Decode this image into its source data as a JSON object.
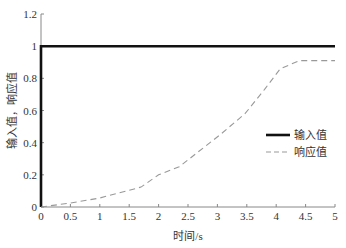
{
  "chart_data": {
    "type": "line",
    "title": "",
    "xlabel": "时间/s",
    "ylabel": "输入值，响应值",
    "xlim": [
      0,
      5
    ],
    "ylim": [
      0,
      1.2
    ],
    "x_ticks": [
      0,
      0.5,
      1,
      1.5,
      2,
      2.5,
      3,
      3.5,
      4,
      4.5,
      5
    ],
    "x_tick_labels": [
      "0",
      "0.5",
      "1",
      "1.5",
      "2",
      "2.5",
      "3",
      "3.5",
      "4",
      "4.5",
      "5"
    ],
    "y_ticks": [
      0,
      0.2,
      0.4,
      0.6,
      0.8,
      1,
      1.2
    ],
    "y_tick_labels": [
      "0",
      "0.2",
      "0.4",
      "0.6",
      "0.8",
      "1",
      "1.2"
    ],
    "grid": false,
    "legend_position": "right-middle",
    "series": [
      {
        "name": "输入值",
        "style": "solid",
        "color": "#111111",
        "x": [
          0,
          0,
          5
        ],
        "y": [
          0,
          1,
          1
        ]
      },
      {
        "name": "响应值",
        "style": "dashed",
        "color": "#999999",
        "x": [
          0,
          0.5,
          1.0,
          1.7,
          2.0,
          2.35,
          3.05,
          3.47,
          3.8,
          4.07,
          4.4,
          5.0
        ],
        "y": [
          0,
          0.025,
          0.056,
          0.124,
          0.2,
          0.25,
          0.45,
          0.58,
          0.73,
          0.86,
          0.91,
          0.91
        ]
      }
    ]
  }
}
